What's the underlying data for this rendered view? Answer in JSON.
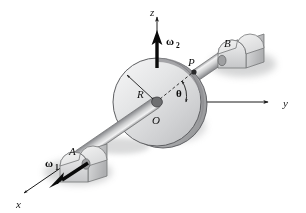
{
  "figure": {
    "background_color": "#ffffff",
    "ink_color": "#1a1a1a"
  },
  "axes": {
    "x": {
      "label": "x",
      "direction": "down-left"
    },
    "y": {
      "label": "y",
      "direction": "right"
    },
    "z": {
      "label": "z",
      "direction": "up"
    }
  },
  "labels": {
    "origin": "O",
    "radius": "R",
    "point_p": "P",
    "angle": "θ",
    "bearing_a": "A",
    "bearing_b": "B",
    "omega1_symbol": "ω",
    "omega1_sub": "1",
    "omega2_symbol": "ω",
    "omega2_sub": "2"
  },
  "colors": {
    "disk_fill_light": "#ececed",
    "disk_fill_mid": "#d2d3d4",
    "disk_fill_dark": "#b4b5b7",
    "disk_edge": "#6a6a6c",
    "shaft_light": "#f0f0f1",
    "shaft_mid": "#c9cacb",
    "shaft_dark": "#8d8e90",
    "block_light": "#f2f2f3",
    "block_mid": "#d8d9da",
    "block_dark": "#a9aaac",
    "shadow": "#b9b9bb",
    "arrow_black": "#0a0a0a"
  },
  "geometry": {
    "origin_px": [
      157,
      102
    ],
    "disk_radius_px": 44,
    "theta_deg": 38
  }
}
